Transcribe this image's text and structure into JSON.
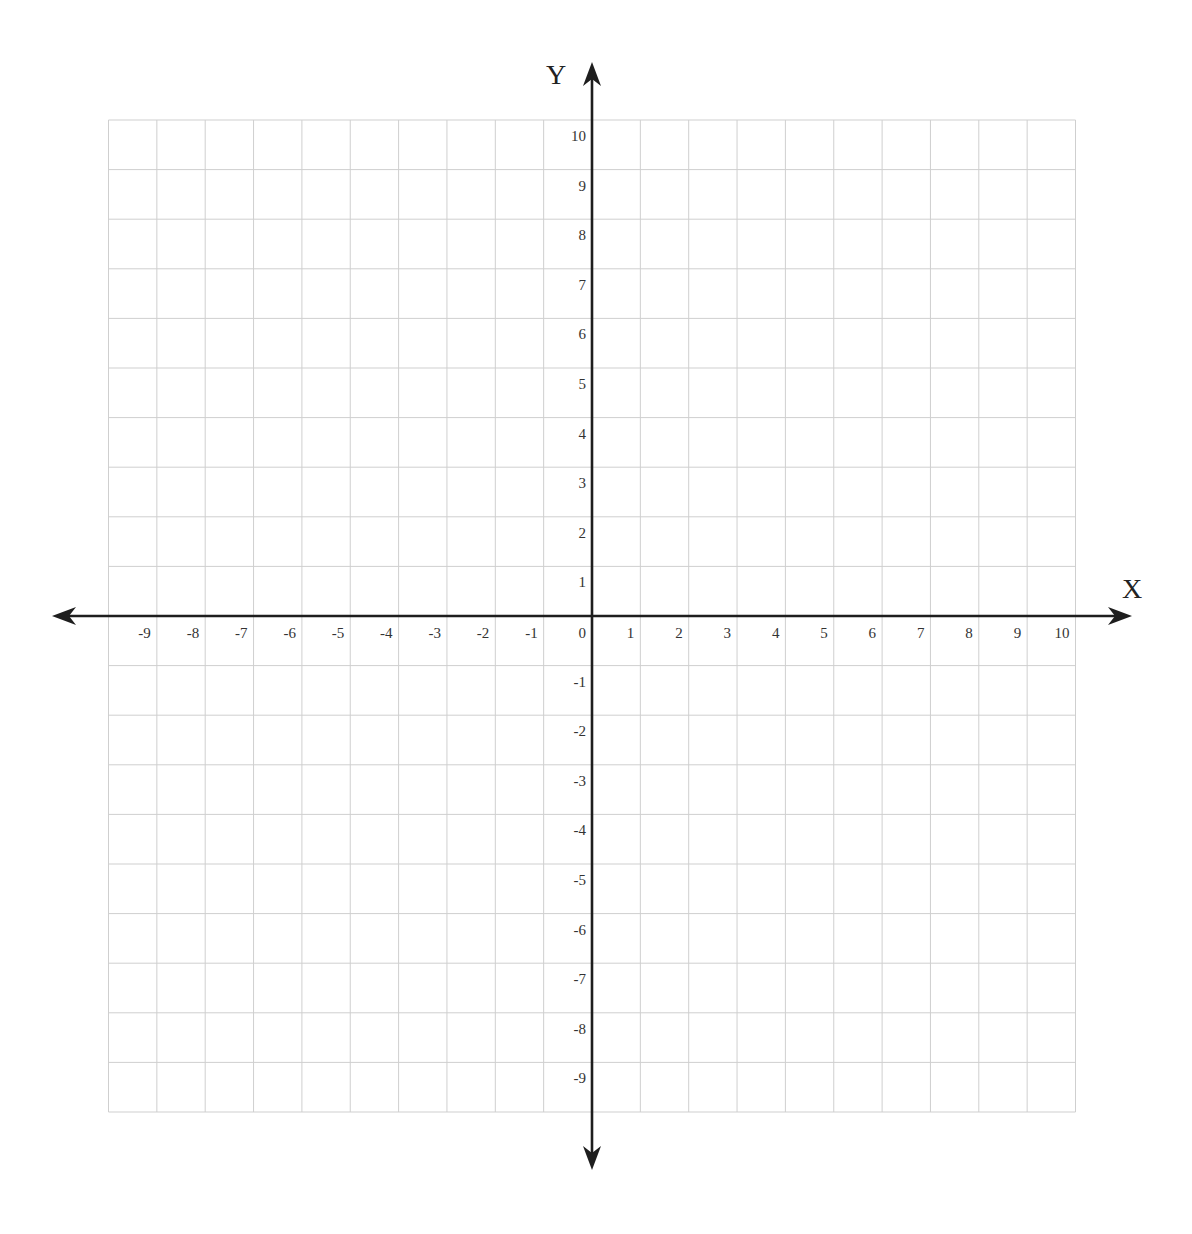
{
  "chart_data": {
    "type": "scatter",
    "title": "",
    "xlabel": "X",
    "ylabel": "Y",
    "xlim": [
      -10,
      10
    ],
    "ylim": [
      -10,
      10
    ],
    "grid": true,
    "x_ticks": [
      -9,
      -8,
      -7,
      -6,
      -5,
      -4,
      -3,
      -2,
      -1,
      0,
      1,
      2,
      3,
      4,
      5,
      6,
      7,
      8,
      9,
      10
    ],
    "y_ticks": [
      10,
      9,
      8,
      7,
      6,
      5,
      4,
      3,
      2,
      1,
      -1,
      -2,
      -3,
      -4,
      -5,
      -6,
      -7,
      -8,
      -9
    ],
    "series": [],
    "legend": null
  },
  "layout": {
    "origin_px": [
      592,
      616
    ],
    "unit_x_px": 48.35,
    "unit_y_px": 49.6,
    "x_arrow_left": 52,
    "x_arrow_right": 1132,
    "y_arrow_top": 62,
    "y_arrow_bottom": 1170
  },
  "colors": {
    "grid": "#cfcfcf",
    "axis": "#1e1e1e",
    "labels": "#333333"
  }
}
